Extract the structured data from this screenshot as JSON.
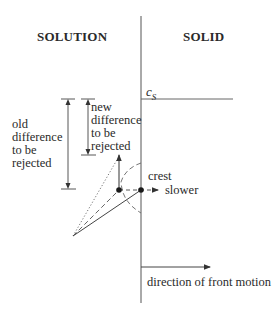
{
  "diagram": {
    "regions": {
      "left": "SOLUTION",
      "right": "SOLID"
    },
    "labels": {
      "cs": "c",
      "cs_sub": "S",
      "old_difference": "old\ndifference\nto be\nrejected",
      "new_difference": "new\ndifference\nto be\nrejected",
      "crest": "crest",
      "slower": "slower",
      "front_motion": "direction of front motion"
    },
    "colors": {
      "line": "#555555",
      "text": "#2a2a2a",
      "background": "#ffffff"
    }
  }
}
